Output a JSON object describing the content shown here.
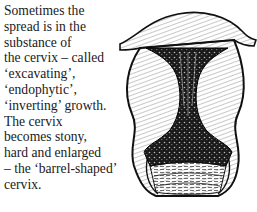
{
  "document": {
    "caption_lines": [
      "Sometimes the",
      "spread is in the",
      "substance of",
      "the cervix – called",
      "‘excavating’,",
      "‘endophytic’,",
      "‘inverting’ growth.",
      "The cervix",
      "becomes stony,",
      "hard and enlarged",
      "– the ‘barrel-shaped’",
      "cervix."
    ],
    "illustration": {
      "subject": "barrel-shaped cervix cross-section",
      "ink_color": "#111111",
      "paper_color": "#ffffff"
    }
  }
}
